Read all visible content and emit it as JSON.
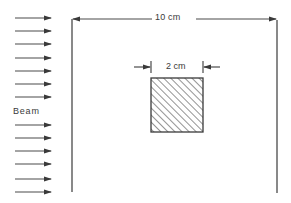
{
  "diagram": {
    "labels": {
      "plate_width": "10 cm",
      "target_width": "2 cm",
      "beam": "Beam"
    },
    "colors": {
      "line": "#4a4a4a",
      "hatch": "#3a3a3a",
      "background": "#ffffff"
    },
    "beam_arrows_count": 13,
    "target_fill": "diagonal-hatch"
  }
}
